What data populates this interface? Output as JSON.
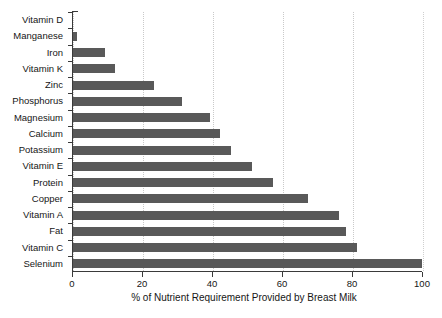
{
  "chart_data": {
    "type": "bar",
    "orientation": "horizontal",
    "title": "",
    "xlabel": "% of Nutrient Requirement Provided by Breast Milk",
    "ylabel": "",
    "xlim": [
      0,
      100
    ],
    "xticks": [
      0,
      20,
      40,
      60,
      80,
      100
    ],
    "xtick_labels": [
      "0",
      "20",
      "40",
      "60",
      "80",
      "100"
    ],
    "grid": "vertical dotted gridlines at each x tick",
    "legend": "none",
    "bar_color": "#595959",
    "categories": [
      "Vitamin D",
      "Manganese",
      "Iron",
      "Vitamin K",
      "Zinc",
      "Phosphorus",
      "Magnesium",
      "Calcium",
      "Potassium",
      "Vitamin E",
      "Protein",
      "Copper",
      "Vitamin A",
      "Fat",
      "Vitamin C",
      "Selenium"
    ],
    "values": [
      0,
      1,
      9,
      12,
      23,
      31,
      39,
      42,
      45,
      51,
      57,
      67,
      76,
      78,
      81,
      100
    ],
    "series": [
      {
        "name": "% of Nutrient Requirement Provided by Breast Milk",
        "values": [
          0,
          1,
          9,
          12,
          23,
          31,
          39,
          42,
          45,
          51,
          57,
          67,
          76,
          78,
          81,
          100
        ]
      }
    ]
  },
  "colors": {
    "bar": "#595959",
    "axis": "#3a3a3a",
    "grid": "#c9c9c9",
    "text": "#161616",
    "background": "#ffffff"
  }
}
